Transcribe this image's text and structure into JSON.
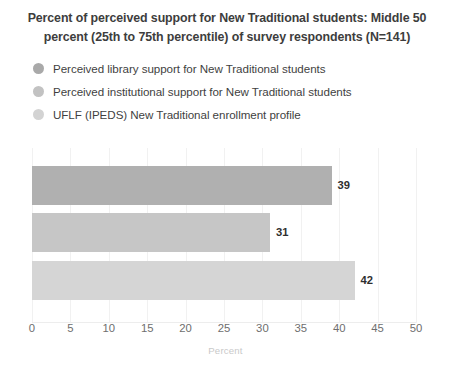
{
  "chart_data": {
    "type": "bar",
    "orientation": "horizontal",
    "title": "Percent of perceived support for New Traditional students: Middle 50 percent (25th to 75th percentile) of survey respondents (N=141)",
    "title_lines": [
      "Percent of perceived support for New Traditional students: Middle 50",
      "percent (25th to 75th percentile) of survey respondents (N=141)"
    ],
    "xlabel": "Percent",
    "ylabel": "",
    "xlim": [
      0,
      50
    ],
    "xticks": [
      0,
      5,
      10,
      15,
      20,
      25,
      30,
      35,
      40,
      45,
      50
    ],
    "xtick_labels": [
      "0",
      "5",
      "10",
      "15",
      "20",
      "25",
      "30",
      "35",
      "40",
      "45",
      "50"
    ],
    "grid": true,
    "legend_position": "top",
    "categories": [
      "Perceived library support for New Traditional students",
      "Perceived institutional support for New Traditional students",
      "UFLF (IPEDS) New Traditional enrollment profile"
    ],
    "values": [
      39,
      31,
      42
    ],
    "value_labels": [
      "39",
      "31",
      "42"
    ],
    "colors": [
      "#b0b0b0",
      "#c6c6c6",
      "#d5d5d5"
    ],
    "bars": [
      {
        "label": "Perceived library support for New Traditional students",
        "value": 39,
        "value_label": "39",
        "color": "#b0b0b0"
      },
      {
        "label": "Perceived institutional support for New Traditional students",
        "value": 31,
        "value_label": "31",
        "color": "#c6c6c6"
      },
      {
        "label": "UFLF (IPEDS) New Traditional enrollment profile",
        "value": 42,
        "value_label": "42",
        "color": "#d5d5d5"
      }
    ]
  },
  "legend": {
    "items": [
      {
        "label": "Perceived library support for New Traditional students",
        "color": "#a9a9a9"
      },
      {
        "label": "Perceived institutional support for New Traditional students",
        "color": "#c2c2c2"
      },
      {
        "label": "UFLF (IPEDS) New Traditional enrollment profile",
        "color": "#d3d3d3"
      }
    ]
  },
  "theme": {
    "background": "#ffffff",
    "text_color": "#3f3f3f",
    "tick_color": "#6e6e6e",
    "axis_title_color": "#c9c9c9",
    "gridline_color": "#f1f1f1"
  }
}
